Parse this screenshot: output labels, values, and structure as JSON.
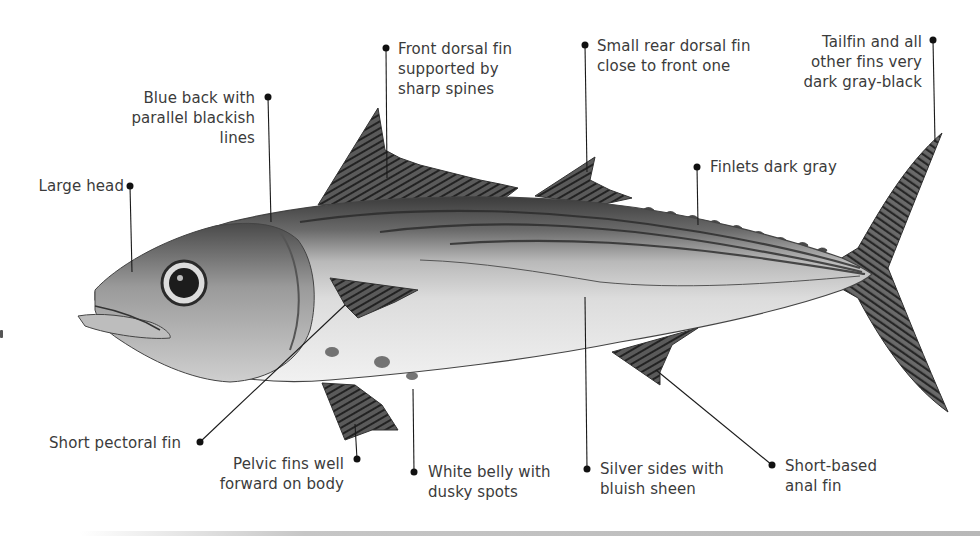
{
  "diagram": {
    "colors": {
      "background": "#ffffff",
      "label_text": "#3b3b3b",
      "leader_line": "#1a1a1a",
      "fin_dark": "#3a3a3a",
      "back_dark": "#4a4a4a",
      "belly_light": "#e9e9e9"
    },
    "labels": [
      {
        "id": "large-head",
        "text": "Large head"
      },
      {
        "id": "blue-back",
        "text": "Blue back with\nparallel blackish\nlines"
      },
      {
        "id": "front-dorsal",
        "text": "Front dorsal fin\nsupported by\nsharp spines"
      },
      {
        "id": "rear-dorsal",
        "text": "Small rear dorsal fin\nclose to front one"
      },
      {
        "id": "tailfin",
        "text": "Tailfin and all\nother fins very\ndark gray-black"
      },
      {
        "id": "finlets",
        "text": "Finlets dark gray"
      },
      {
        "id": "pectoral",
        "text": "Short pectoral fin"
      },
      {
        "id": "pelvic",
        "text": "Pelvic fins well\nforward on body"
      },
      {
        "id": "white-belly",
        "text": "White belly with\ndusky spots"
      },
      {
        "id": "silver-sides",
        "text": "Silver sides with\nbluish sheen"
      },
      {
        "id": "anal-fin",
        "text": "Short-based\nanal fin"
      }
    ]
  }
}
